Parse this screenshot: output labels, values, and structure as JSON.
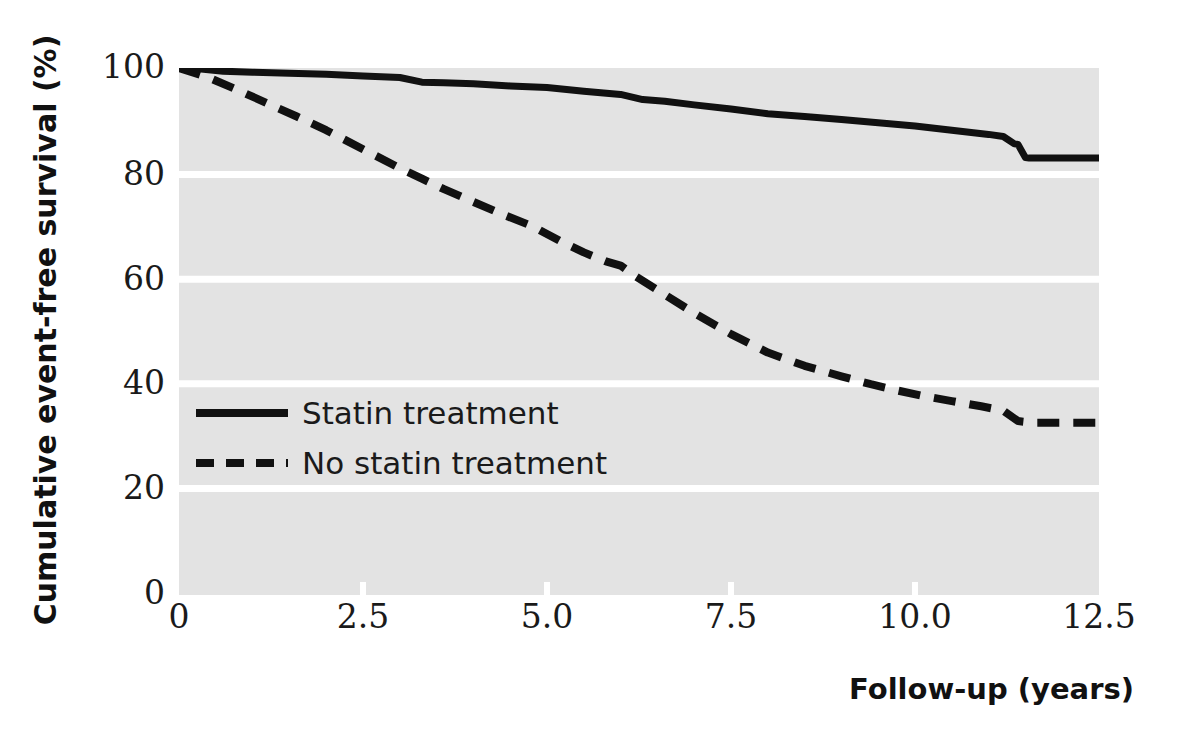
{
  "chart_data": {
    "type": "line",
    "title": "",
    "subtitle": "",
    "xlabel": "Follow-up (years)",
    "ylabel": "Cumulative event-free survival (%)",
    "xlim": [
      0,
      12.5
    ],
    "ylim": [
      0,
      100
    ],
    "xticks": [
      "0",
      "2.5",
      "5.0",
      "7.5",
      "10.0",
      "12.5"
    ],
    "xtick_values": [
      0,
      2.5,
      5.0,
      7.5,
      10.0,
      12.5
    ],
    "yticks": [
      "0",
      "20",
      "40",
      "60",
      "80",
      "100"
    ],
    "ytick_values": [
      0,
      20,
      40,
      60,
      80,
      100
    ],
    "grid": "horizontal-white-on-gray",
    "legend_position": "inside-left",
    "plot_bgcolor": "#e3e3e3",
    "grid_color": "#ffffff",
    "line_color": "#111111",
    "series": [
      {
        "name": "Statin treatment",
        "style": "solid",
        "x": [
          0,
          0.3,
          0.6,
          1.0,
          1.5,
          2.0,
          2.5,
          3.0,
          3.3,
          3.6,
          4.0,
          4.5,
          5.0,
          5.5,
          6.0,
          6.3,
          6.6,
          7.0,
          7.5,
          8.0,
          8.5,
          9.0,
          9.5,
          10.0,
          10.5,
          11.0,
          11.2,
          11.35,
          11.4,
          11.5,
          11.55,
          12.5
        ],
        "y": [
          100,
          99.8,
          99.4,
          99.2,
          99.0,
          98.8,
          98.5,
          98.2,
          97.3,
          97.2,
          97.0,
          96.6,
          96.3,
          95.6,
          95.0,
          94.0,
          93.7,
          93.0,
          92.2,
          91.3,
          90.8,
          90.2,
          89.6,
          89.0,
          88.2,
          87.4,
          87.0,
          85.6,
          85.5,
          83.0,
          82.9,
          82.9
        ]
      },
      {
        "name": "No statin treatment",
        "style": "dashed",
        "x": [
          0,
          0.4,
          0.8,
          1.2,
          1.6,
          2.0,
          2.5,
          3.0,
          3.3,
          3.6,
          4.0,
          4.4,
          4.8,
          5.2,
          5.5,
          5.8,
          6.0,
          6.2,
          6.6,
          7.0,
          7.5,
          8.0,
          8.5,
          9.0,
          9.4,
          9.7,
          10.1,
          10.5,
          10.9,
          11.2,
          11.4,
          11.6,
          12.5
        ],
        "y": [
          100,
          98.2,
          95.8,
          93.3,
          90.8,
          88.2,
          84.6,
          81.0,
          79.0,
          77.0,
          74.6,
          72.2,
          70.0,
          67.0,
          65.0,
          63.3,
          62.5,
          60.5,
          57.0,
          53.5,
          49.5,
          46.0,
          43.5,
          41.5,
          40.0,
          39.0,
          37.8,
          36.8,
          35.8,
          35.0,
          33.0,
          32.7,
          32.7
        ]
      }
    ],
    "annotations": []
  },
  "legend": {
    "items": [
      {
        "label": "Statin treatment",
        "style": "solid"
      },
      {
        "label": "No statin treatment",
        "style": "dashed"
      }
    ]
  },
  "axes": {
    "x_axis_title": "Follow-up (years)",
    "y_axis_title": "Cumulative event-free survival (%)",
    "x_tick_labels": [
      "0",
      "2.5",
      "5.0",
      "7.5",
      "10.0",
      "12.5"
    ],
    "y_tick_labels": [
      "100",
      "80",
      "60",
      "40",
      "20",
      "0"
    ]
  }
}
